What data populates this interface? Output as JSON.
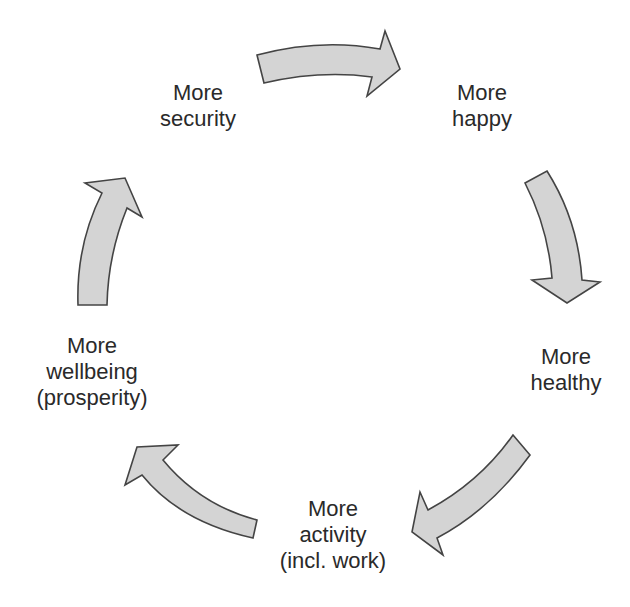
{
  "diagram": {
    "type": "cycle",
    "colors": {
      "arrow_fill": "#d4d4d4",
      "arrow_stroke": "#444444",
      "text": "#2a2a2a",
      "background": "#ffffff"
    },
    "nodes": [
      {
        "id": "security",
        "lines": [
          "More",
          "security"
        ]
      },
      {
        "id": "happy",
        "lines": [
          "More",
          "happy"
        ]
      },
      {
        "id": "healthy",
        "lines": [
          "More",
          "healthy"
        ]
      },
      {
        "id": "activity",
        "lines": [
          "More",
          "activity",
          "(incl. work)"
        ]
      },
      {
        "id": "wellbeing",
        "lines": [
          "More",
          "wellbeing",
          "(prosperity)"
        ]
      }
    ],
    "edges": [
      {
        "from": "security",
        "to": "happy"
      },
      {
        "from": "happy",
        "to": "healthy"
      },
      {
        "from": "healthy",
        "to": "activity"
      },
      {
        "from": "activity",
        "to": "wellbeing"
      },
      {
        "from": "wellbeing",
        "to": "security"
      }
    ]
  }
}
